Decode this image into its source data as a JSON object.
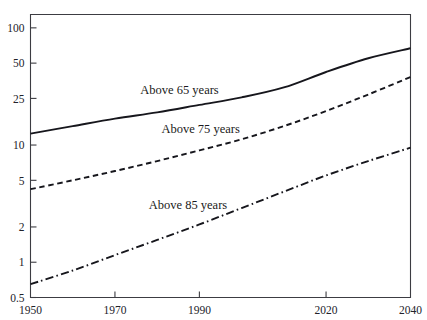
{
  "chart_data": {
    "type": "line",
    "title": "",
    "subtitle": "",
    "xlabel": "",
    "ylabel": "",
    "yscale": "log",
    "xscale": "linear",
    "grid": false,
    "legend_position": "inline-labels",
    "xlim": [
      1950,
      2040
    ],
    "ylim": [
      0.5,
      130
    ],
    "x_ticks": [
      1950,
      1970,
      1990,
      2020,
      2040
    ],
    "x_tick_labels": [
      "1950",
      "1970",
      "1990",
      "2020",
      "2040"
    ],
    "y_ticks": [
      0.5,
      1,
      2,
      5,
      10,
      25,
      50,
      100
    ],
    "y_tick_labels": [
      "0.5",
      "1",
      "2",
      "5",
      "10",
      "25",
      "50",
      "100"
    ],
    "series": [
      {
        "name": "Above 65 years",
        "style": "solid",
        "label_text": "Above 65 years",
        "x": [
          1950,
          1960,
          1970,
          1980,
          1990,
          2000,
          2010,
          2020,
          2030,
          2040
        ],
        "values": [
          12.5,
          14.5,
          16.8,
          19.0,
          22.0,
          25.5,
          31.0,
          42.0,
          55.0,
          67.0
        ]
      },
      {
        "name": "Above 75 years",
        "style": "dashed",
        "label_text": "Above 75 years",
        "x": [
          1950,
          1960,
          1970,
          1980,
          1990,
          2000,
          2010,
          2020,
          2030,
          2040
        ],
        "values": [
          4.2,
          5.0,
          6.0,
          7.3,
          9.0,
          11.2,
          14.5,
          19.5,
          27.0,
          38.0
        ]
      },
      {
        "name": "Above 85 years",
        "style": "dashdot",
        "label_text": "Above 85 years",
        "x": [
          1950,
          1960,
          1970,
          1980,
          1990,
          2000,
          2010,
          2020,
          2030,
          2040
        ],
        "values": [
          0.65,
          0.85,
          1.15,
          1.55,
          2.1,
          2.9,
          4.0,
          5.5,
          7.3,
          9.5
        ]
      }
    ],
    "annotations": [
      {
        "text": "Above 65 years",
        "x": 1976,
        "y": 27.5
      },
      {
        "text": "Above 75 years",
        "x": 1981,
        "y": 12.6
      },
      {
        "text": "Above 85 years",
        "x": 1978,
        "y": 2.85
      }
    ]
  },
  "colors": {
    "axis": "#3c3c42",
    "line": "#16161c",
    "text": "#22222a",
    "background": "#ffffff"
  }
}
